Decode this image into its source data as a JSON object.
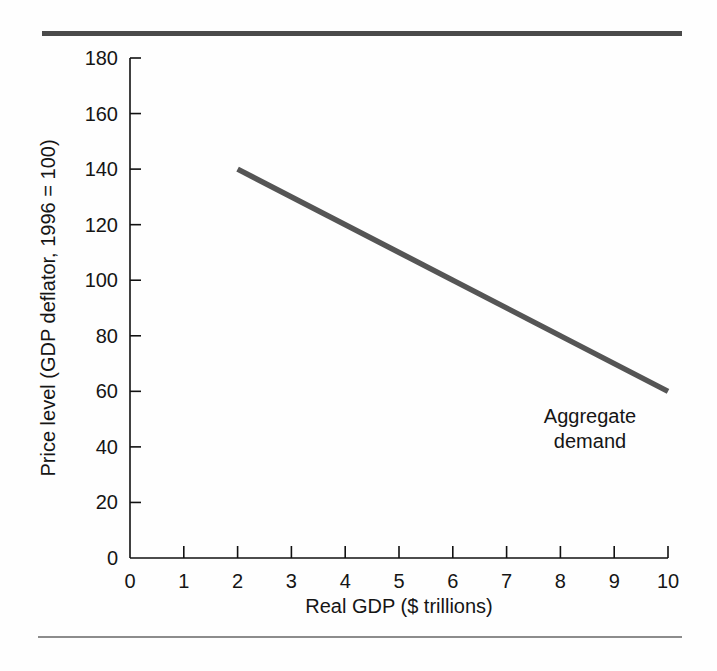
{
  "figure": {
    "background_color": "#fefefe",
    "rule_color_top": "#4a4a4a",
    "rule_color_bottom": "#8c8c8c"
  },
  "chart_data": {
    "type": "line",
    "title": "",
    "subtitle": "",
    "xlabel": "Real GDP ($ trillions)",
    "ylabel": "Price level (GDP deflator, 1996 = 100)",
    "xlim": [
      0,
      10
    ],
    "ylim": [
      0,
      180
    ],
    "grid": false,
    "legend_position": "none",
    "xticks": [
      "0",
      "1",
      "2",
      "3",
      "4",
      "5",
      "6",
      "7",
      "8",
      "9",
      "10"
    ],
    "yticks": [
      "0",
      "20",
      "40",
      "60",
      "80",
      "100",
      "120",
      "140",
      "160",
      "180"
    ],
    "xtick_values": [
      0,
      1,
      2,
      3,
      4,
      5,
      6,
      7,
      8,
      9,
      10
    ],
    "ytick_values": [
      0,
      20,
      40,
      60,
      80,
      100,
      120,
      140,
      160,
      180
    ],
    "series": [
      {
        "name": "Aggregate demand",
        "color": "#555555",
        "line_width": 5.5,
        "x": [
          2,
          10
        ],
        "y": [
          140,
          60
        ],
        "points": [
          {
            "x": 2,
            "y": 140
          },
          {
            "x": 10,
            "y": 60
          }
        ]
      }
    ],
    "annotations": [
      {
        "name": "aggregate-demand-label",
        "lines": [
          "Aggregate",
          "demand"
        ],
        "x": 8.5,
        "y": 46
      }
    ]
  },
  "axis_style": {
    "spine_color": "#111111",
    "spine_width": 1.6,
    "tick_color": "#111111",
    "tick_length": 11,
    "tick_direction": "in"
  }
}
